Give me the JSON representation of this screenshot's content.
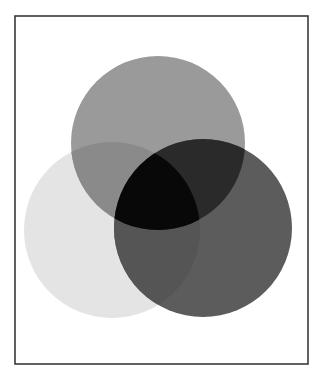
{
  "figure": {
    "type": "venn-diagram",
    "set_count": 3,
    "frame": {
      "x": 15,
      "y": 16,
      "width": 293,
      "height": 348,
      "stroke": "#3a3a3a",
      "stroke_width": 1.6,
      "fill": "#ffffff"
    },
    "background": "#ffffff",
    "sets": [
      {
        "id": "top",
        "cx": 158,
        "cy": 143,
        "r": 87,
        "fill": "#9a9a9a"
      },
      {
        "id": "left",
        "cx": 112,
        "cy": 230,
        "r": 88,
        "fill": "#e4e4e4"
      },
      {
        "id": "right",
        "cx": 203,
        "cy": 228,
        "r": 89,
        "fill": "#5c5c5c"
      }
    ],
    "overlaps": {
      "top_left": "#8a8a8a",
      "top_right": "#2a2a2a",
      "left_right": "#555555",
      "top_left_right": "#080808"
    }
  }
}
